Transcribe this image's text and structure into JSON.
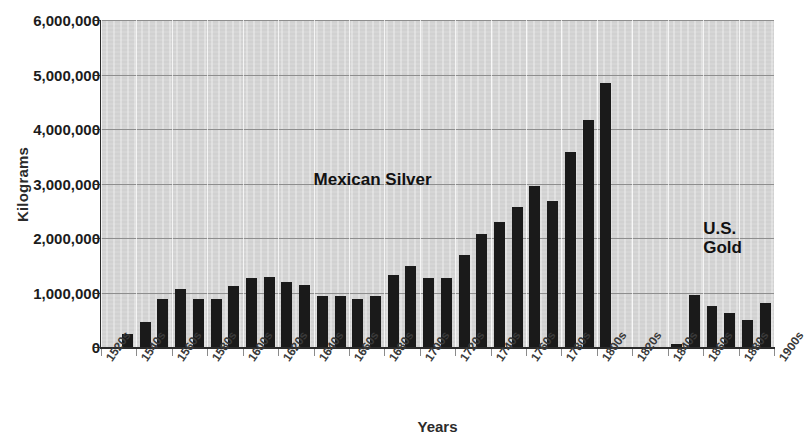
{
  "chart_data": {
    "type": "bar",
    "title": "",
    "xlabel": "Years",
    "ylabel": "Kilograms",
    "ylim": [
      0,
      6000000
    ],
    "ytick_values": [
      0,
      1000000,
      2000000,
      3000000,
      4000000,
      5000000,
      6000000
    ],
    "ytick_labels": [
      "0",
      "1,000,000",
      "2,000,000",
      "3,000,000",
      "4,000,000",
      "5,000,000",
      "6,000,000"
    ],
    "grid": "horizontal-and-vertical",
    "legend": "none",
    "annotations": [
      {
        "text": "Mexican Silver",
        "x_decade": "1640s",
        "y_value": 3250000
      },
      {
        "text": "U.S.\nGold",
        "x_decade": "1860s",
        "y_value": 2350000
      }
    ],
    "xtick_labels": [
      "1520s",
      "1540s",
      "1560s",
      "1580s",
      "1600s",
      "1620s",
      "1640s",
      "1660s",
      "1680s",
      "1700s",
      "1720s",
      "1740s",
      "1760s",
      "1780s",
      "1800s",
      "1820s",
      "1840s",
      "1860s",
      "1880s",
      "1900s"
    ],
    "categories": [
      "1520s",
      "1530s",
      "1540s",
      "1550s",
      "1560s",
      "1570s",
      "1580s",
      "1590s",
      "1600s",
      "1610s",
      "1620s",
      "1630s",
      "1640s",
      "1650s",
      "1660s",
      "1670s",
      "1680s",
      "1690s",
      "1700s",
      "1710s",
      "1720s",
      "1730s",
      "1740s",
      "1750s",
      "1760s",
      "1770s",
      "1780s",
      "1790s",
      "1800s",
      "1810s",
      "1820s",
      "1830s",
      "1840s",
      "1850s",
      "1860s",
      "1870s",
      "1880s",
      "1890s"
    ],
    "values": [
      0,
      230000,
      450000,
      880000,
      1070000,
      880000,
      880000,
      1120000,
      1260000,
      1280000,
      1190000,
      1130000,
      930000,
      930000,
      880000,
      930000,
      1320000,
      1480000,
      1270000,
      1260000,
      1690000,
      2080000,
      2290000,
      2560000,
      2960000,
      2680000,
      3570000,
      4160000,
      4850000,
      0,
      0,
      0,
      60000,
      950000,
      760000,
      620000,
      500000,
      800000
    ],
    "series_note": "Bars 1520s-1800s are Mexican Silver; bars 1840s-1890s are U.S. Gold; 1810s-1830s have no bars"
  },
  "colors": {
    "bar": "#1a1a1a",
    "plot_background": "#d4d4d4",
    "gridline": "#8e8e8e",
    "axis": "#2b2b2b",
    "text": "#1c1c1c"
  }
}
